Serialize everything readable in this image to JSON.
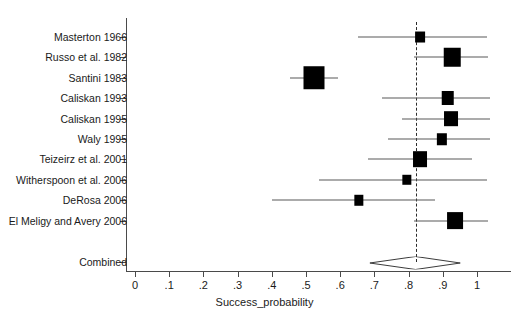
{
  "axis": {
    "x_title": "Success_probability",
    "x_ticks": [
      "0",
      ".1",
      ".2",
      ".3",
      ".4",
      ".5",
      ".6",
      ".7",
      ".8",
      ".9",
      "1"
    ],
    "x_tick_values": [
      0,
      0.1,
      0.2,
      0.3,
      0.4,
      0.5,
      0.6,
      0.7,
      0.8,
      0.9,
      1
    ],
    "xmin": 0,
    "xmax": 1,
    "null_line_value": 0.82,
    "marker_color": "#000000",
    "line_color": "#585858",
    "axis_color": "#4a4a4a"
  },
  "chart_data": {
    "type": "scatter",
    "title": "",
    "xlabel": "Success_probability",
    "ylabel": "",
    "xlim": [
      0,
      1
    ],
    "grid": false,
    "legend": "none",
    "reference_line": 0.82,
    "categories": [
      "Masterton 1966",
      "Russo et al. 1982",
      "Santini 1983",
      "Caliskan 1993",
      "Caliskan 1995",
      "Waly 1995",
      "Teizeirz et al. 2001",
      "Witherspoon et al. 2006",
      "DeRosa 2006",
      "El Meligy and Avery 2006",
      "Combined"
    ],
    "studies": [
      {
        "label": "Masterton 1966",
        "estimate": 0.833,
        "ci_low": 0.651,
        "ci_high": 1.029,
        "weight": 0.3,
        "marker": "square"
      },
      {
        "label": "Russo et al. 1982",
        "estimate": 0.927,
        "ci_low": 0.816,
        "ci_high": 1.032,
        "weight": 0.72,
        "marker": "square"
      },
      {
        "label": "Santini 1983",
        "estimate": 0.523,
        "ci_low": 0.453,
        "ci_high": 0.594,
        "weight": 1.0,
        "marker": "square"
      },
      {
        "label": "Caliskan 1993",
        "estimate": 0.915,
        "ci_low": 0.722,
        "ci_high": 1.038,
        "weight": 0.47,
        "marker": "square"
      },
      {
        "label": "Caliskan 1995",
        "estimate": 0.924,
        "ci_low": 0.781,
        "ci_high": 1.038,
        "weight": 0.56,
        "marker": "square"
      },
      {
        "label": "Waly 1995",
        "estimate": 0.898,
        "ci_low": 0.74,
        "ci_high": 1.038,
        "weight": 0.33,
        "marker": "square"
      },
      {
        "label": "Teizeirz et al. 2001",
        "estimate": 0.833,
        "ci_low": 0.681,
        "ci_high": 0.985,
        "weight": 0.56,
        "marker": "square"
      },
      {
        "label": "Witherspoon et al. 2006",
        "estimate": 0.795,
        "ci_low": 0.539,
        "ci_high": 1.029,
        "weight": 0.27,
        "marker": "square"
      },
      {
        "label": "DeRosa 2006",
        "estimate": 0.655,
        "ci_low": 0.401,
        "ci_high": 0.877,
        "weight": 0.27,
        "marker": "square"
      },
      {
        "label": "El Meligy and Avery 2006",
        "estimate": 0.936,
        "ci_low": 0.816,
        "ci_high": 1.032,
        "weight": 0.68,
        "marker": "square"
      }
    ],
    "combined": {
      "label": "Combined",
      "estimate": 0.82,
      "ci_low": 0.686,
      "ci_high": 0.951,
      "marker": "diamond"
    }
  }
}
